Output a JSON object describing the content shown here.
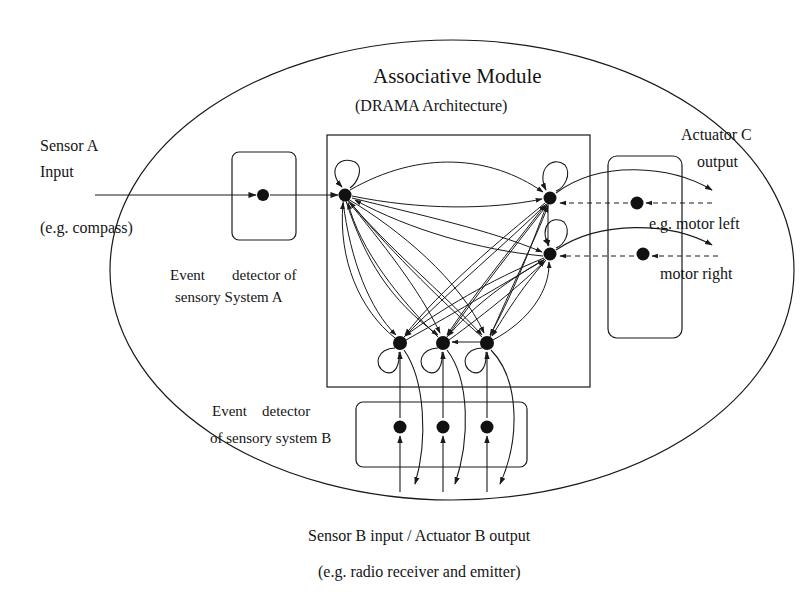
{
  "title": "Associative Module",
  "subtitle": "(DRAMA Architecture)",
  "sensor_a": {
    "line1": "Sensor A",
    "line2": "Input",
    "example": "(e.g. compass)"
  },
  "event_detector_a": {
    "line1_a": "Event",
    "line1_b": "detector of",
    "line2": "sensory System A"
  },
  "actuator_c": {
    "line1": "Actuator C",
    "line2": "output",
    "motor_left": "e.g. motor left",
    "motor_right": "motor right"
  },
  "event_detector_b": {
    "line1_a": "Event",
    "line1_b": "detector",
    "line2": "of sensory system B"
  },
  "sensor_b": {
    "line1": "Sensor B input / Actuator B output",
    "line2": "(e.g. radio receiver  and emitter)"
  },
  "colors": {
    "stroke": "#1a1a1a",
    "node": "#111111",
    "background": "#ffffff"
  },
  "network": {
    "nodes": [
      {
        "id": "A1",
        "x": 345,
        "y": 194
      },
      {
        "id": "C1",
        "x": 550,
        "y": 197
      },
      {
        "id": "C2",
        "x": 550,
        "y": 254
      },
      {
        "id": "B1",
        "x": 400,
        "y": 342
      },
      {
        "id": "B2",
        "x": 443,
        "y": 342
      },
      {
        "id": "B3",
        "x": 487,
        "y": 342
      }
    ]
  }
}
